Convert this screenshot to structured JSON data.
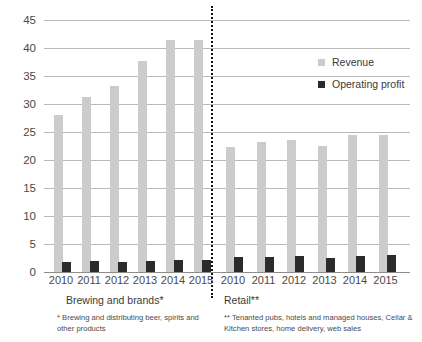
{
  "chart_data": {
    "type": "bar",
    "title": "",
    "subtitle": "",
    "xlabel": "",
    "ylabel": "",
    "ylim": [
      0,
      45
    ],
    "yticks": [
      0,
      5,
      10,
      15,
      20,
      25,
      30,
      35,
      40,
      45
    ],
    "grid": true,
    "legend_position": "top-right",
    "categories": [
      "2010",
      "2011",
      "2012",
      "2013",
      "2014",
      "2015",
      "2010",
      "2011",
      "2012",
      "2013",
      "2014",
      "2015"
    ],
    "groups": [
      {
        "name": "Brewing and brands*",
        "categories": [
          "2010",
          "2011",
          "2012",
          "2013",
          "2014",
          "2015"
        ],
        "series": [
          {
            "name": "Revenue",
            "values": [
              28.1,
              31.3,
              33.3,
              37.7,
              41.5,
              41.5
            ]
          },
          {
            "name": "Operating profit",
            "values": [
              1.8,
              1.9,
              1.8,
              1.9,
              2.2,
              2.2
            ]
          }
        ]
      },
      {
        "name": "Retail**",
        "categories": [
          "2010",
          "2011",
          "2012",
          "2013",
          "2014",
          "2015"
        ],
        "series": [
          {
            "name": "Revenue",
            "values": [
              22.4,
              23.3,
              23.5,
              22.5,
              24.5,
              24.5
            ]
          },
          {
            "name": "Operating profit",
            "values": [
              2.6,
              2.6,
              2.8,
              2.5,
              2.9,
              3.1
            ]
          }
        ]
      }
    ],
    "series": [
      {
        "name": "Revenue",
        "values": [
          28.1,
          31.3,
          33.3,
          37.7,
          41.5,
          41.5,
          22.4,
          23.3,
          23.5,
          22.5,
          24.5,
          24.5
        ]
      },
      {
        "name": "Operating profit",
        "values": [
          1.8,
          1.9,
          1.8,
          1.9,
          2.2,
          2.2,
          2.6,
          2.6,
          2.8,
          2.5,
          2.9,
          3.1
        ]
      }
    ],
    "colors": {
      "revenue": "#cccccc",
      "operating_profit": "#2b2b2b",
      "grid": "#b9b9b9",
      "divider": "#111111"
    },
    "annotations": [
      "Brewing and brands*",
      "Retail**",
      "* Brewing and distributing beer, spirits and other products",
      "** Tenanted pubs, hotels and managed houses, Cellar & Kitchen stores, home delivery, web sales"
    ]
  },
  "legend": {
    "items": [
      {
        "label": "Revenue",
        "color": "#cccccc"
      },
      {
        "label": "Operating profit",
        "color": "#2b2b2b"
      }
    ]
  },
  "axis": {
    "y_labels": [
      "45",
      "40",
      "35",
      "30",
      "25",
      "20",
      "15",
      "10",
      "5",
      "0"
    ],
    "x_labels": [
      "2010",
      "2011",
      "2012",
      "2013",
      "2014",
      "2015",
      "2010",
      "2011",
      "2012",
      "2013",
      "2014",
      "2015"
    ]
  },
  "captions": {
    "left_title": "Brewing and brands*",
    "right_title": "Retail**",
    "left_note": "* Brewing and distributing beer, spirits and other products",
    "right_note": "** Tenanted pubs, hotels and managed houses, Cellar & Kitchen stores, home delivery, web sales"
  }
}
